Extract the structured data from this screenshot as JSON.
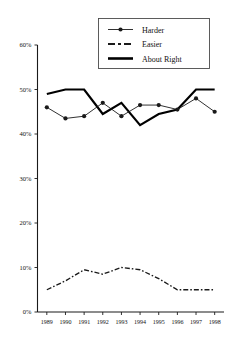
{
  "chart_data": {
    "type": "line",
    "title": "",
    "xlabel": "",
    "ylabel": "",
    "categories": [
      "1989",
      "1990",
      "1991",
      "1992",
      "1993",
      "1994",
      "1995",
      "1996",
      "1997",
      "1998"
    ],
    "ylim": [
      0,
      60
    ],
    "ytick_labels": [
      "0%",
      "10%",
      "20%",
      "30%",
      "40%",
      "50%",
      "60%"
    ],
    "ytick_values": [
      0,
      10,
      20,
      30,
      40,
      50,
      60
    ],
    "grid": false,
    "legend_position": "top-right",
    "series": [
      {
        "name": "Harder",
        "style": "thin-line-with-markers",
        "values": [
          46,
          43.5,
          44,
          47,
          44,
          46.5,
          46.5,
          45.5,
          48,
          45
        ]
      },
      {
        "name": "Easier",
        "style": "dashed-line",
        "values": [
          5,
          7,
          9.5,
          8.5,
          10,
          9.5,
          7.5,
          5,
          5,
          5
        ]
      },
      {
        "name": "About Right",
        "style": "thick-line",
        "values": [
          49,
          50,
          50,
          44.5,
          47,
          42,
          44.5,
          45.5,
          50,
          50
        ]
      }
    ]
  },
  "legend": {
    "items": [
      {
        "label": "Harder",
        "swatch": "line-marker-swatch"
      },
      {
        "label": "Easier",
        "swatch": "dashed-line-swatch"
      },
      {
        "label": "About Right",
        "swatch": "thick-line-swatch"
      }
    ]
  }
}
